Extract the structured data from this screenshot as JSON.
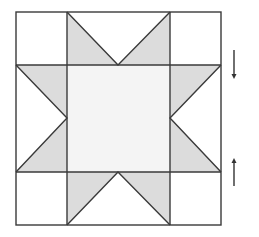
{
  "diagram": {
    "type": "quilt-block",
    "grid": {
      "rows": 3,
      "cols": 3
    },
    "colors": {
      "background": "#ffffff",
      "stroke": "#3a3a3a",
      "star_point_fill": "#dcdcdc",
      "center_fill": "#f4f4f4",
      "corner_fill": "#ffffff",
      "arrow": "#333333"
    },
    "arrows": [
      {
        "direction": "down",
        "position": "right-upper"
      },
      {
        "direction": "up",
        "position": "right-lower"
      }
    ]
  }
}
